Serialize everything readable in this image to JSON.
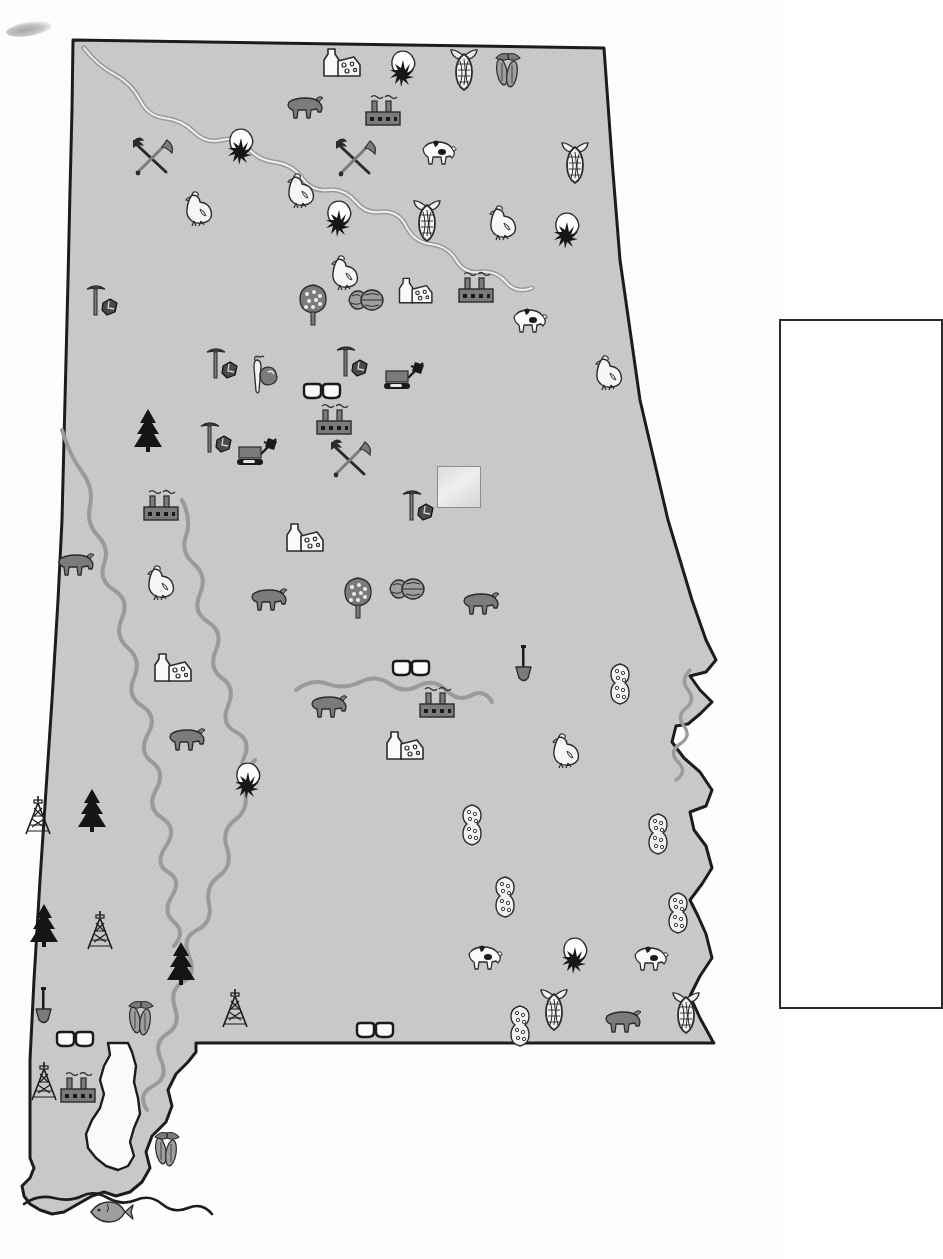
{
  "map": {
    "title": "Alabama Resource and Economic Activity Map",
    "state": "Alabama",
    "fill_color": "#c9c9c9",
    "outline_color": "#1c1c1c",
    "river_color": "#9a9a9a",
    "background_color": "#fdfdfd",
    "water_fill": "#f2f2f2"
  },
  "legend": {
    "present": true,
    "empty": true,
    "label": "",
    "border_color": "#2b2b2b",
    "x": 779,
    "y": 319,
    "width": 160,
    "height": 686
  },
  "blank_label_box": {
    "x": 437,
    "y": 466,
    "width": 42,
    "height": 40
  },
  "symbol_types": [
    {
      "key": "dairy",
      "name": "milk-bottle-and-cheese-icon",
      "meaning": "Dairy products"
    },
    {
      "key": "cotton",
      "name": "cotton-boll-icon",
      "meaning": "Cotton"
    },
    {
      "key": "corn",
      "name": "corn-ear-icon",
      "meaning": "Corn"
    },
    {
      "key": "soybean",
      "name": "soybean-plant-icon",
      "meaning": "Soybeans"
    },
    {
      "key": "factory",
      "name": "factory-icon",
      "meaning": "Manufacturing"
    },
    {
      "key": "cattle",
      "name": "beef-cattle-icon",
      "meaning": "Beef cattle"
    },
    {
      "key": "chicken",
      "name": "poultry-chicken-icon",
      "meaning": "Poultry"
    },
    {
      "key": "hog",
      "name": "hog-pig-icon",
      "meaning": "Hogs"
    },
    {
      "key": "pick_coal",
      "name": "pick-and-coal-icon",
      "meaning": "Coal mining"
    },
    {
      "key": "pick_shovel",
      "name": "crossed-pick-and-shovel-icon",
      "meaning": "Mining"
    },
    {
      "key": "peanut",
      "name": "peanut-icon",
      "meaning": "Peanuts"
    },
    {
      "key": "pecan",
      "name": "pecan-nuts-icon",
      "meaning": "Pecans"
    },
    {
      "key": "peach_tree",
      "name": "peach-tree-icon",
      "meaning": "Peaches / fruit"
    },
    {
      "key": "pine",
      "name": "pine-tree-icon",
      "meaning": "Forest / timber"
    },
    {
      "key": "derrick",
      "name": "oil-derrick-icon",
      "meaning": "Oil and natural gas"
    },
    {
      "key": "shovel",
      "name": "shovel-icon",
      "meaning": "Sand and gravel"
    },
    {
      "key": "glasses",
      "name": "eyeglasses-icon",
      "meaning": "Optical / glass products"
    },
    {
      "key": "dozer",
      "name": "bulldozer-icon",
      "meaning": "Construction machinery"
    },
    {
      "key": "sweetpotato",
      "name": "sweet-potato-and-carrot-icon",
      "meaning": "Vegetables"
    },
    {
      "key": "fish",
      "name": "fish-icon",
      "meaning": "Fishing"
    }
  ],
  "symbols": [
    {
      "t": "dairy",
      "x": 339,
      "y": 63,
      "s": 1.0
    },
    {
      "t": "cotton",
      "x": 405,
      "y": 66,
      "s": 1.0
    },
    {
      "t": "corn",
      "x": 464,
      "y": 70,
      "s": 1.0
    },
    {
      "t": "soybean",
      "x": 508,
      "y": 72,
      "s": 1.0
    },
    {
      "t": "factory",
      "x": 383,
      "y": 113,
      "s": 1.0
    },
    {
      "t": "cattle",
      "x": 305,
      "y": 108,
      "s": 1.0
    },
    {
      "t": "cotton",
      "x": 243,
      "y": 144,
      "s": 1.0
    },
    {
      "t": "pick_shovel",
      "x": 152,
      "y": 157,
      "s": 1.0
    },
    {
      "t": "pick_shovel",
      "x": 355,
      "y": 158,
      "s": 1.0
    },
    {
      "t": "hog",
      "x": 438,
      "y": 152,
      "s": 1.0
    },
    {
      "t": "corn",
      "x": 575,
      "y": 163,
      "s": 1.0
    },
    {
      "t": "chicken",
      "x": 300,
      "y": 190,
      "s": 1.0
    },
    {
      "t": "chicken",
      "x": 198,
      "y": 208,
      "s": 1.0
    },
    {
      "t": "cotton",
      "x": 341,
      "y": 216,
      "s": 1.0
    },
    {
      "t": "corn",
      "x": 427,
      "y": 221,
      "s": 1.0
    },
    {
      "t": "chicken",
      "x": 502,
      "y": 222,
      "s": 1.0
    },
    {
      "t": "cotton",
      "x": 569,
      "y": 228,
      "s": 1.0
    },
    {
      "t": "chicken",
      "x": 344,
      "y": 272,
      "s": 1.0
    },
    {
      "t": "dairy",
      "x": 411,
      "y": 289,
      "s": 0.9
    },
    {
      "t": "factory",
      "x": 476,
      "y": 290,
      "s": 1.0
    },
    {
      "t": "peach_tree",
      "x": 313,
      "y": 305,
      "s": 1.0
    },
    {
      "t": "pecan",
      "x": 365,
      "y": 300,
      "s": 1.0
    },
    {
      "t": "pick_coal",
      "x": 101,
      "y": 300,
      "s": 1.0
    },
    {
      "t": "hog",
      "x": 529,
      "y": 320,
      "s": 1.0
    },
    {
      "t": "pick_coal",
      "x": 221,
      "y": 363,
      "s": 1.0
    },
    {
      "t": "pick_coal",
      "x": 351,
      "y": 361,
      "s": 1.0
    },
    {
      "t": "sweetpotato",
      "x": 264,
      "y": 375,
      "s": 1.0
    },
    {
      "t": "glasses",
      "x": 322,
      "y": 392,
      "s": 1.0
    },
    {
      "t": "dozer",
      "x": 405,
      "y": 377,
      "s": 1.0
    },
    {
      "t": "chicken",
      "x": 608,
      "y": 372,
      "s": 1.0
    },
    {
      "t": "pine",
      "x": 148,
      "y": 430,
      "s": 1.0
    },
    {
      "t": "pick_coal",
      "x": 215,
      "y": 437,
      "s": 1.0
    },
    {
      "t": "factory",
      "x": 334,
      "y": 422,
      "s": 1.0
    },
    {
      "t": "dozer",
      "x": 258,
      "y": 453,
      "s": 1.0
    },
    {
      "t": "pick_shovel",
      "x": 350,
      "y": 459,
      "s": 1.0
    },
    {
      "t": "factory",
      "x": 161,
      "y": 508,
      "s": 1.0
    },
    {
      "t": "pick_coal",
      "x": 417,
      "y": 505,
      "s": 1.0
    },
    {
      "t": "dairy",
      "x": 302,
      "y": 538,
      "s": 1.0
    },
    {
      "t": "cattle",
      "x": 76,
      "y": 565,
      "s": 1.0
    },
    {
      "t": "chicken",
      "x": 160,
      "y": 582,
      "s": 1.0
    },
    {
      "t": "cattle",
      "x": 269,
      "y": 600,
      "s": 1.0
    },
    {
      "t": "peach_tree",
      "x": 358,
      "y": 598,
      "s": 1.0
    },
    {
      "t": "pecan",
      "x": 406,
      "y": 589,
      "s": 1.0
    },
    {
      "t": "cattle",
      "x": 481,
      "y": 604,
      "s": 1.0
    },
    {
      "t": "dairy",
      "x": 170,
      "y": 668,
      "s": 1.0
    },
    {
      "t": "glasses",
      "x": 411,
      "y": 669,
      "s": 1.0
    },
    {
      "t": "shovel",
      "x": 523,
      "y": 664,
      "s": 1.0
    },
    {
      "t": "cattle",
      "x": 329,
      "y": 707,
      "s": 1.0
    },
    {
      "t": "factory",
      "x": 437,
      "y": 705,
      "s": 1.0
    },
    {
      "t": "cattle",
      "x": 187,
      "y": 740,
      "s": 1.0
    },
    {
      "t": "dairy",
      "x": 402,
      "y": 746,
      "s": 1.0
    },
    {
      "t": "chicken",
      "x": 565,
      "y": 750,
      "s": 1.0
    },
    {
      "t": "peanut",
      "x": 620,
      "y": 684,
      "s": 1.0
    },
    {
      "t": "cotton",
      "x": 250,
      "y": 778,
      "s": 1.0
    },
    {
      "t": "derrick",
      "x": 38,
      "y": 815,
      "s": 1.0
    },
    {
      "t": "pine",
      "x": 92,
      "y": 810,
      "s": 1.0
    },
    {
      "t": "peanut",
      "x": 472,
      "y": 825,
      "s": 1.0
    },
    {
      "t": "peanut",
      "x": 658,
      "y": 834,
      "s": 1.0
    },
    {
      "t": "pine",
      "x": 44,
      "y": 925,
      "s": 1.0
    },
    {
      "t": "derrick",
      "x": 100,
      "y": 930,
      "s": 1.0
    },
    {
      "t": "peanut",
      "x": 505,
      "y": 897,
      "s": 1.0
    },
    {
      "t": "peanut",
      "x": 678,
      "y": 913,
      "s": 1.0
    },
    {
      "t": "pine",
      "x": 181,
      "y": 963,
      "s": 1.0
    },
    {
      "t": "hog",
      "x": 484,
      "y": 957,
      "s": 1.0
    },
    {
      "t": "cotton",
      "x": 577,
      "y": 953,
      "s": 1.0
    },
    {
      "t": "hog",
      "x": 650,
      "y": 958,
      "s": 1.0
    },
    {
      "t": "shovel",
      "x": 43,
      "y": 1006,
      "s": 1.0
    },
    {
      "t": "derrick",
      "x": 235,
      "y": 1008,
      "s": 1.0
    },
    {
      "t": "corn",
      "x": 554,
      "y": 1010,
      "s": 1.0
    },
    {
      "t": "peanut",
      "x": 520,
      "y": 1026,
      "s": 1.0
    },
    {
      "t": "cattle",
      "x": 623,
      "y": 1022,
      "s": 1.0
    },
    {
      "t": "corn",
      "x": 686,
      "y": 1013,
      "s": 1.0
    },
    {
      "t": "glasses",
      "x": 75,
      "y": 1040,
      "s": 1.0
    },
    {
      "t": "glasses",
      "x": 375,
      "y": 1031,
      "s": 1.0
    },
    {
      "t": "derrick",
      "x": 44,
      "y": 1081,
      "s": 1.0
    },
    {
      "t": "factory",
      "x": 78,
      "y": 1090,
      "s": 1.0
    },
    {
      "t": "soybean",
      "x": 141,
      "y": 1020,
      "s": 1.0
    },
    {
      "t": "soybean",
      "x": 167,
      "y": 1151,
      "s": 1.0
    },
    {
      "t": "fish",
      "x": 111,
      "y": 1212,
      "s": 1.0
    }
  ]
}
